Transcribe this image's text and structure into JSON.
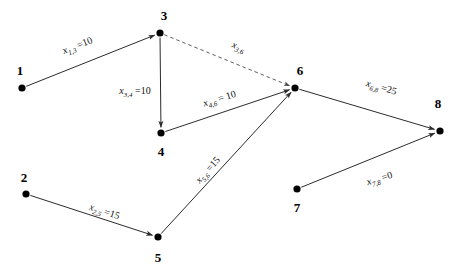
{
  "diagram": {
    "type": "directed-graph",
    "width": 460,
    "height": 275,
    "background_color": "#ffffff",
    "stroke_color": "#2b2b2b",
    "node_color": "#000000",
    "nodes": [
      {
        "id": "1",
        "label": "1",
        "x": 22,
        "y": 88,
        "label_x": 20,
        "label_y": 70
      },
      {
        "id": "2",
        "label": "2",
        "x": 26,
        "y": 194,
        "label_x": 24,
        "label_y": 177
      },
      {
        "id": "3",
        "label": "3",
        "x": 160,
        "y": 33,
        "label_x": 164,
        "label_y": 15
      },
      {
        "id": "4",
        "label": "4",
        "x": 161,
        "y": 133,
        "label_x": 161,
        "label_y": 151
      },
      {
        "id": "5",
        "label": "5",
        "x": 158,
        "y": 237,
        "label_x": 158,
        "label_y": 257
      },
      {
        "id": "6",
        "label": "6",
        "x": 295,
        "y": 88,
        "label_x": 300,
        "label_y": 70
      },
      {
        "id": "7",
        "label": "7",
        "x": 297,
        "y": 189,
        "label_x": 297,
        "label_y": 207
      },
      {
        "id": "8",
        "label": "8",
        "x": 440,
        "y": 131,
        "label_x": 438,
        "label_y": 103
      }
    ],
    "edges": [
      {
        "id": "e-1-3",
        "from": "1",
        "to": "3",
        "style": "solid",
        "variable": "x",
        "subscript": "1,3",
        "equals": "=10",
        "label_text": "x1,3 =10",
        "label_x": 78,
        "label_y": 47,
        "label_rotation": -21
      },
      {
        "id": "e-3-4",
        "from": "3",
        "to": "4",
        "style": "solid",
        "variable": "x",
        "subscript": "3,4",
        "equals": "=10",
        "label_text": "x3,4 =10",
        "label_x": 135,
        "label_y": 92,
        "label_rotation": 0
      },
      {
        "id": "e-3-6",
        "from": "3",
        "to": "6",
        "style": "dashed",
        "variable": "x",
        "subscript": "3,6",
        "equals": "",
        "label_text": "x3,6",
        "label_x": 238,
        "label_y": 48,
        "label_rotation": 22
      },
      {
        "id": "e-4-6",
        "from": "4",
        "to": "6",
        "style": "solid",
        "variable": "x",
        "subscript": "4,6",
        "equals": "= 10",
        "label_text": "x4,6 = 10",
        "label_x": 220,
        "label_y": 100,
        "label_rotation": -17
      },
      {
        "id": "e-2-5",
        "from": "2",
        "to": "5",
        "style": "solid",
        "variable": "x",
        "subscript": "2,5",
        "equals": "=15",
        "label_text": "x2,5 =15",
        "label_x": 104,
        "label_y": 213,
        "label_rotation": 18
      },
      {
        "id": "e-5-6",
        "from": "5",
        "to": "6",
        "style": "solid",
        "variable": "x",
        "subscript": "5,6",
        "equals": "=15",
        "label_text": "x5,6 =15",
        "label_x": 209,
        "label_y": 171,
        "label_rotation": -48
      },
      {
        "id": "e-6-8",
        "from": "6",
        "to": "8",
        "style": "solid",
        "variable": "x",
        "subscript": "6,8",
        "equals": "=25",
        "label_text": "x6,8 =25",
        "label_x": 381,
        "label_y": 89,
        "label_rotation": 16
      },
      {
        "id": "e-7-8",
        "from": "7",
        "to": "8",
        "style": "solid",
        "variable": "x",
        "subscript": "7,8",
        "equals": "=0",
        "label_text": "x7,8 =0",
        "label_x": 380,
        "label_y": 180,
        "label_rotation": -17
      }
    ]
  }
}
